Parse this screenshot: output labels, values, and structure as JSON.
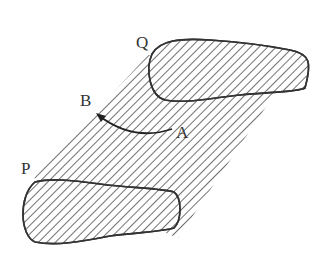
{
  "diagram": {
    "labels": {
      "Q": "Q",
      "B": "B",
      "A": "A",
      "P": "P"
    },
    "colors": {
      "stroke": "#333333",
      "background": "#ffffff"
    },
    "elements": [
      {
        "name": "upper-region",
        "description": "closed hatched shape near Q"
      },
      {
        "name": "lower-region",
        "description": "closed hatched shape near P"
      },
      {
        "name": "swept-band",
        "description": "diagonal hatched band connecting the two regions"
      },
      {
        "name": "arrow-A-to-B",
        "description": "curved arrow from A to B"
      }
    ]
  }
}
